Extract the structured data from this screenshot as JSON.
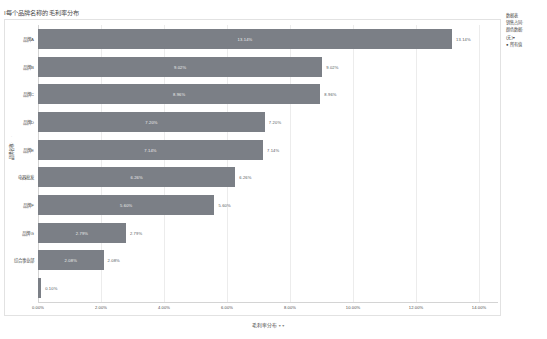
{
  "title": "I每个品牌名称的毛利率分布",
  "legend": {
    "lines": [
      "数据表",
      "销售占同·",
      "颜色数据:",
      "(无)▾",
      "● 所有值"
    ]
  },
  "axes": {
    "y_title": "品牌名称",
    "y_dots": "· · ·",
    "x_title": "毛利率分布",
    "x_caret": "▾ ▾",
    "x_ticks": [
      "0.00%",
      "2.00%",
      "4.00%",
      "6.00%",
      "8.00%",
      "10.00%",
      "12.00%",
      "14.00%"
    ],
    "x_tick_values": [
      0,
      2,
      4,
      6,
      8,
      10,
      12,
      14
    ]
  },
  "footer_mark": "",
  "chart_data": {
    "type": "bar",
    "orientation": "horizontal",
    "title": "I每个品牌名称的毛利率分布",
    "xlabel": "毛利率分布",
    "ylabel": "品牌名称",
    "xlim": [
      0,
      14.6
    ],
    "grid": true,
    "legend_position": "right",
    "bar_color": "#7b7f86",
    "categories": [
      "品牌A",
      "品牌B",
      "品牌C",
      "品牌D",
      "品牌E",
      "电器批发",
      "品牌F",
      "品牌G",
      "综合事业部"
    ],
    "values": [
      13.14,
      9.02,
      8.96,
      7.2,
      7.14,
      6.26,
      5.6,
      2.79,
      2.08
    ],
    "labels": [
      "13.14%",
      "9.02%",
      "8.96%",
      "7.20%",
      "7.14%",
      "6.26%",
      "5.60%",
      "2.79%",
      "2.08%"
    ],
    "extra_bar": {
      "value": 0.1,
      "label": "0.10%",
      "category": ""
    }
  }
}
